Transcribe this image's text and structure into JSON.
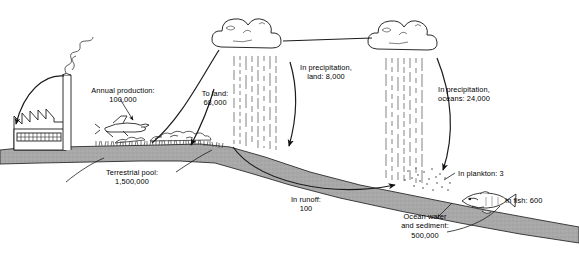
{
  "figure": {
    "background_color": "#ffffff",
    "ink_color": "#000000",
    "ground_fill": "#a8a8a8",
    "cloud_fill": "#ffffff"
  },
  "labels": {
    "annual_production": "Annual production:\n100,000",
    "to_land": "To land:\n68,000",
    "precip_land": "In precipitation,\nland: 8,000",
    "precip_oceans": "In precipitation,\noceans: 24,000",
    "terrestrial_pool": "Terrestrial pool:\n1,500,000",
    "in_runoff": "In runoff:\n100",
    "in_plankton": "In plankton: 3",
    "in_fish": "In fish: 600",
    "ocean_water": "Ocean water\nand sediment:\n500,000"
  },
  "flows": [
    {
      "name": "annual-production",
      "label": "Annual production",
      "value": 100000
    },
    {
      "name": "to-land",
      "label": "To land",
      "value": 68000
    },
    {
      "name": "precipitation-land",
      "label": "In precipitation, land",
      "value": 8000
    },
    {
      "name": "precipitation-oceans",
      "label": "In precipitation, oceans",
      "value": 24000
    },
    {
      "name": "runoff",
      "label": "In runoff",
      "value": 100
    }
  ],
  "pools": [
    {
      "name": "terrestrial-pool",
      "label": "Terrestrial pool",
      "value": 1500000
    },
    {
      "name": "ocean-water-sediment",
      "label": "Ocean water and sediment",
      "value": 500000
    },
    {
      "name": "plankton",
      "label": "In plankton",
      "value": 3
    },
    {
      "name": "fish",
      "label": "In fish",
      "value": 600
    }
  ],
  "icons": {
    "factory": "factory-icon",
    "smokestack": "smokestack-icon",
    "smoke": "smoke-plume-icon",
    "airplane": "crop-duster-airplane-icon",
    "cloud_left": "cloud-icon",
    "cloud_right": "cloud-icon",
    "rain_left": "rain-streaks-icon",
    "rain_right": "rain-streaks-icon",
    "fish": "fish-icon",
    "plankton": "plankton-dots-icon",
    "vegetation": "vegetation-icon"
  }
}
